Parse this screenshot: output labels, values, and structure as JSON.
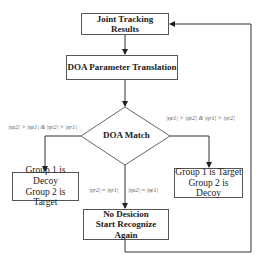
{
  "nodes": {
    "joint_tracking": {
      "label": "Joint Tracking Results"
    },
    "doa_translation": {
      "label": "DOA Parameter Translation"
    },
    "doa_match": {
      "label": "DOA Match"
    },
    "left_result": {
      "line1": "Group 1 is Decoy",
      "line2": "Group 2 is Target"
    },
    "right_result": {
      "line1": "Group 1 is Target",
      "line2": "Group 2 is Decoy"
    },
    "no_decision": {
      "line1": "No Desicion",
      "line2": "Start Recognize Again"
    }
  },
  "edge_labels": {
    "left": "|ηe2| > |ηe1| & |ηr2| > |ηr1|",
    "right": "|ηe1| > |ηe2| & |ηr1| > |ηr2|",
    "bottom_left": "|ηr2| ≈ |ηr1|",
    "bottom_right": "|ηe2| ≈ |ηe1|"
  },
  "colors": {
    "line": "#333333",
    "box_border": "#555555",
    "text": "#222222"
  }
}
